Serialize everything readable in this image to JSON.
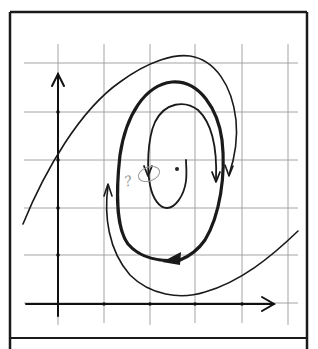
{
  "diagram": {
    "type": "phase-portrait-sketch",
    "grid": {
      "vertical_x": [
        58,
        104,
        150,
        195,
        242,
        288
      ],
      "horizontal_y": [
        63,
        112,
        160,
        208,
        255,
        303
      ],
      "color": "#9a9a9a"
    },
    "axes": {
      "origin": [
        58,
        303
      ],
      "x_axis_end": [
        275,
        303
      ],
      "y_axis_end": [
        58,
        72
      ],
      "tick_marks_x": [
        104,
        150,
        195,
        242
      ],
      "tick_marks_y": [
        112,
        160,
        208,
        255
      ],
      "color": "#111111"
    },
    "annotation": {
      "text": "?",
      "color": "#9a9a9a"
    },
    "center_point": [
      176,
      169
    ],
    "caption": ""
  }
}
